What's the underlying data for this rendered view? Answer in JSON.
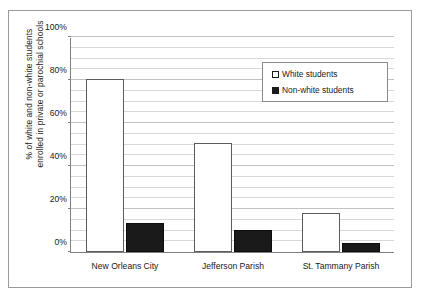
{
  "chart_data": {
    "type": "bar",
    "title": "",
    "subtitle": "",
    "xlabel": "",
    "ylabel_line1": "% of white and non-white students",
    "ylabel_line2": "enrolled in private or parochial schools",
    "categories": [
      "New Orleans City",
      "Jefferson Parish",
      "St. Tammany Parish"
    ],
    "series": [
      {
        "name": "White students",
        "swatch": "hollow-square",
        "color": "#ffffff",
        "values": [
          80.5,
          50.7,
          18.0
        ]
      },
      {
        "name": "Non-white students",
        "swatch": "filled-square",
        "color": "#1a1a1a",
        "values": [
          13.5,
          10.2,
          4.2
        ]
      }
    ],
    "ylim": [
      0,
      100
    ],
    "y_ticks": [
      "0%",
      "20%",
      "40%",
      "60%",
      "80%",
      "100%"
    ],
    "y_tick_values": [
      0,
      20,
      40,
      60,
      80,
      100
    ],
    "y_minor_step": 5,
    "grid": true,
    "grid_orientation": "horizontal",
    "legend_position": "upper-right-inside"
  },
  "legend": {
    "entries": [
      {
        "label": "White students"
      },
      {
        "label": "Non-white students"
      }
    ]
  }
}
